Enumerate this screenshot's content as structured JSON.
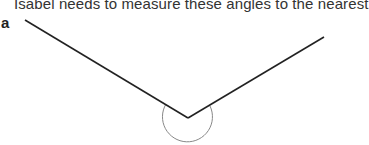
{
  "question": {
    "text": "Isabel needs to measure these angles to the nearest"
  },
  "figure": {
    "label": "a",
    "vertex": [
      188,
      118
    ],
    "ray_left_end": [
      25,
      20
    ],
    "ray_right_end": [
      324,
      37
    ],
    "arc_center": [
      188,
      118
    ],
    "arc_radius": 25,
    "line_color": "#222222",
    "arc_color": "#888888"
  }
}
